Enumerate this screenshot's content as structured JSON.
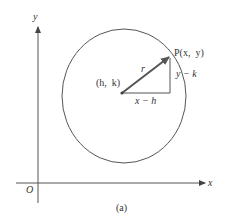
{
  "figure": {
    "caption": "(a)",
    "axes": {
      "x_label": "x",
      "y_label": "y",
      "origin_label": "O"
    },
    "circle": {
      "center_label": "(h,  k)",
      "radius_label": "r"
    },
    "point": {
      "label": "P(x,  y)"
    },
    "legs": {
      "horizontal_label": "x − h",
      "vertical_label": "y − k"
    },
    "colors": {
      "stroke": "#555555",
      "text": "#333333",
      "radius_arrow": "#555555"
    }
  }
}
